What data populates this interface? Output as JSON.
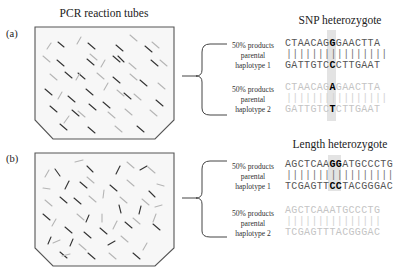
{
  "figure": {
    "tubes_title": "PCR reaction tubes",
    "panels": [
      {
        "label": "(a)",
        "title": "SNP heterozygote",
        "haplotypes": [
          {
            "caption": [
              "50% products",
              "parental",
              "haplotype 1"
            ],
            "top_strand": {
              "pre": "CTAACAG",
              "hl": "G",
              "post": "GAACTTA"
            },
            "bonds": "||||||||||||||||",
            "bottom_strand": {
              "pre": "GATTGTC",
              "hl": "C",
              "post": "CTTGAAT"
            },
            "shade": "dark"
          },
          {
            "caption": [
              "50% products",
              "parental",
              "haplotype 2"
            ],
            "top_strand": {
              "pre": "CTAACAG",
              "hl": "A",
              "post": "GAACTTA"
            },
            "bonds": "||||||||||||||||",
            "bottom_strand": {
              "pre": "GATTGTC",
              "hl": "T",
              "post": "CTTGAAT"
            },
            "shade": "light"
          }
        ]
      },
      {
        "label": "(b)",
        "title": "Length heterozygote",
        "haplotypes": [
          {
            "caption": [
              "50% products",
              "parental",
              "haplotype 1"
            ],
            "top_strand": {
              "pre": "AGCTCAA",
              "hl": "GG",
              "post": "ATGCCCTG"
            },
            "bonds": "|||||||||||||||||",
            "bottom_strand": {
              "pre": "TCGAGTT",
              "hl": "CC",
              "post": "TACGGGAC"
            },
            "shade": "dark"
          },
          {
            "caption": [
              "50% products",
              "parental",
              "haplotype 2"
            ],
            "top_strand": {
              "pre": "AGCTCAAATGCCCTG",
              "hl": "",
              "post": ""
            },
            "bonds": "|||||||||||||||",
            "bottom_strand": {
              "pre": "TCGAGTTTACGGGAC",
              "hl": "",
              "post": ""
            },
            "shade": "light"
          }
        ]
      }
    ],
    "colors": {
      "tube_fill": "#f7f7f7",
      "tube_stroke": "#555555",
      "fragment_dark": "#333333",
      "fragment_light": "#b5b5b5",
      "highlight_band": "#e3e3e3"
    }
  }
}
